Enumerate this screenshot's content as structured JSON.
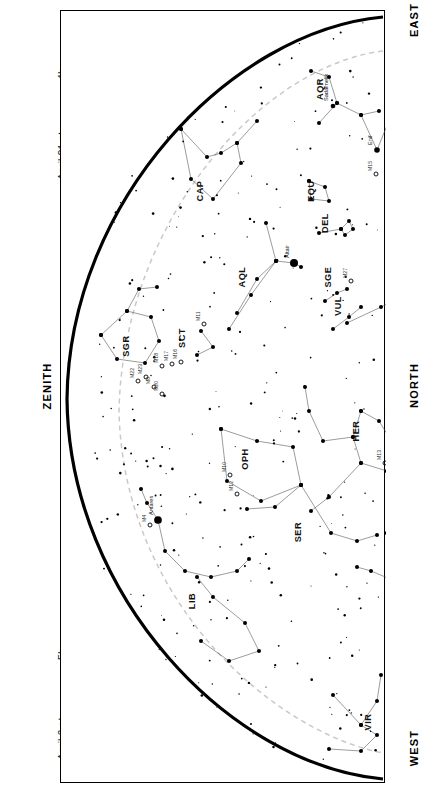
{
  "captions": {
    "top": {
      "lines": [
        {
          "date": "April 21 at",
          "time": "4h"
        },
        {
          "date": "May 21 at",
          "time": "2h"
        },
        {
          "date": "June 21 at",
          "time": "0h"
        },
        {
          "date": "July 21 at",
          "time": "22h"
        },
        {
          "date": "August 21 at",
          "time": "20h"
        }
      ]
    },
    "bottom": {
      "lines": [
        {
          "date": "April 6 at",
          "time": "5h"
        },
        {
          "date": "May 6 at",
          "time": "3h"
        },
        {
          "date": "June 6 at",
          "time": "1h"
        },
        {
          "date": "July 6 at",
          "time": "23h"
        },
        {
          "date": "August 6 at",
          "time": "21h"
        }
      ]
    }
  },
  "compass": {
    "east": "EAST",
    "north": "NORTH",
    "west": "WEST",
    "zenith": "ZENITH"
  },
  "chart_data": {
    "type": "scatter",
    "title": "",
    "xlabel": "",
    "ylabel": "",
    "grid": false,
    "legend": "none",
    "projection": "half-sky horizon map, rotated 90 degrees",
    "colors": {
      "horizon": "#000000",
      "ecliptic": "#c9c9c9",
      "constellation_line": "#4a4a4a",
      "star": "#000000",
      "background": "#ffffff"
    },
    "constellations": [
      {
        "abbr": "AQR",
        "x": 262,
        "y": 78
      },
      {
        "abbr": "CAP",
        "x": 142,
        "y": 180
      },
      {
        "abbr": "EQU",
        "x": 253,
        "y": 180
      },
      {
        "abbr": "DEL",
        "x": 267,
        "y": 212
      },
      {
        "abbr": "AQL",
        "x": 184,
        "y": 266
      },
      {
        "abbr": "SGE",
        "x": 270,
        "y": 266
      },
      {
        "abbr": "VUL",
        "x": 280,
        "y": 295
      },
      {
        "abbr": "CYG",
        "x": 345,
        "y": 292
      },
      {
        "abbr": "LYR",
        "x": 365,
        "y": 340
      },
      {
        "abbr": "SCT",
        "x": 124,
        "y": 327
      },
      {
        "abbr": "SGR",
        "x": 68,
        "y": 335
      },
      {
        "abbr": "HER",
        "x": 298,
        "y": 420
      },
      {
        "abbr": "OPH",
        "x": 187,
        "y": 448
      },
      {
        "abbr": "CRB",
        "x": 337,
        "y": 512
      },
      {
        "abbr": "SER",
        "x": 240,
        "y": 521
      },
      {
        "abbr": "BOO",
        "x": 367,
        "y": 548
      },
      {
        "abbr": "LIB",
        "x": 134,
        "y": 590
      },
      {
        "abbr": "VIR",
        "x": 310,
        "y": 711
      }
    ],
    "named_stars": [
      {
        "name": "Sadalmelik",
        "x": 272,
        "y": 95,
        "mag": 3.0
      },
      {
        "name": "Markab",
        "x": 381,
        "y": 94,
        "mag": 2.5
      },
      {
        "name": "Enif",
        "x": 316,
        "y": 139,
        "mag": 2.4
      },
      {
        "name": "Altair",
        "x": 233,
        "y": 252,
        "mag": 0.8
      },
      {
        "name": "Deneb",
        "x": 391,
        "y": 265,
        "mag": 1.3
      },
      {
        "name": "Vega",
        "x": 348,
        "y": 366,
        "mag": 0.0
      },
      {
        "name": "Arcturus",
        "x": 341,
        "y": 573,
        "mag": 0.0
      },
      {
        "name": "Izar",
        "x": 347,
        "y": 545,
        "mag": 2.4
      },
      {
        "name": "Antares",
        "x": 97,
        "y": 509,
        "mag": 1.0
      }
    ],
    "messier_objects": [
      {
        "name": "M15",
        "x": 315,
        "y": 163
      },
      {
        "name": "M27",
        "x": 290,
        "y": 270
      },
      {
        "name": "M29",
        "x": 370,
        "y": 272
      },
      {
        "name": "M39",
        "x": 385,
        "y": 255
      },
      {
        "name": "M57",
        "x": 356,
        "y": 347
      },
      {
        "name": "M92",
        "x": 333,
        "y": 410
      },
      {
        "name": "M13",
        "x": 324,
        "y": 452
      },
      {
        "name": "M10",
        "x": 169,
        "y": 464
      },
      {
        "name": "M12",
        "x": 176,
        "y": 483
      },
      {
        "name": "M11",
        "x": 143,
        "y": 313
      },
      {
        "name": "M16",
        "x": 120,
        "y": 351
      },
      {
        "name": "M17",
        "x": 111,
        "y": 353
      },
      {
        "name": "M18",
        "x": 101,
        "y": 355
      },
      {
        "name": "M8",
        "x": 93,
        "y": 376
      },
      {
        "name": "M20",
        "x": 101,
        "y": 383
      },
      {
        "name": "M22",
        "x": 77,
        "y": 370
      },
      {
        "name": "M23",
        "x": 85,
        "y": 366
      },
      {
        "name": "M3",
        "x": 394,
        "y": 598
      },
      {
        "name": "M4",
        "x": 89,
        "y": 514
      }
    ],
    "axis_ranges": {
      "x": [
        0,
        325
      ],
      "y": [
        0,
        773
      ]
    }
  }
}
